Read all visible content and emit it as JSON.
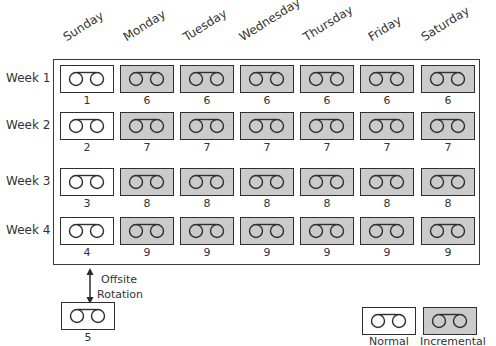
{
  "diagram": {
    "days": [
      "Sunday",
      "Monday",
      "Tuesday",
      "Wednesday",
      "Thursday",
      "Friday",
      "Saturday"
    ],
    "weeks": [
      {
        "label": "Week 1",
        "tapes": [
          "1",
          "6",
          "6",
          "6",
          "6",
          "6",
          "6"
        ]
      },
      {
        "label": "Week 2",
        "tapes": [
          "2",
          "7",
          "7",
          "7",
          "7",
          "7",
          "7"
        ]
      },
      {
        "label": "Week 3",
        "tapes": [
          "3",
          "8",
          "8",
          "8",
          "8",
          "8",
          "8"
        ]
      },
      {
        "label": "Week 4",
        "tapes": [
          "4",
          "9",
          "9",
          "9",
          "9",
          "9",
          "9"
        ]
      }
    ],
    "tape_types": [
      "normal",
      "incremental",
      "incremental",
      "incremental",
      "incremental",
      "incremental",
      "incremental"
    ],
    "offsite": {
      "label_line1": "Offsite",
      "label_line2": "Rotation",
      "tape": "5",
      "tape_type": "normal"
    },
    "legend": {
      "normal": "Normal",
      "incremental": "Incremental"
    },
    "colors": {
      "normal_fill": "#ffffff",
      "incremental_fill": "#cbcbcb",
      "stroke": "#2e2e2e"
    }
  }
}
